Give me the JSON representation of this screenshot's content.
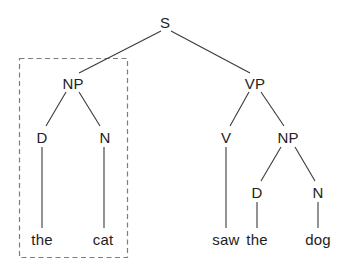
{
  "tree": {
    "type": "syntax-tree",
    "nodes": {
      "s": "S",
      "np_left": "NP",
      "vp": "VP",
      "d_left": "D",
      "n_left": "N",
      "v": "V",
      "np_right": "NP",
      "d_right": "D",
      "n_right": "N"
    },
    "leaves": {
      "the_left": "the",
      "cat": "cat",
      "saw": "saw",
      "the_right": "the",
      "dog": "dog"
    },
    "colors": {
      "edge": "#3a3a3a",
      "text": "#232323",
      "dashed_box": "#7d7d7d",
      "background": "#ffffff"
    }
  }
}
